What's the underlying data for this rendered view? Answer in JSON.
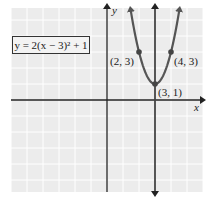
{
  "chart_data": {
    "type": "line",
    "title": "y = 2(x − 3)² + 1",
    "equation": {
      "lhs": "y",
      "rhs": "2(x − 3)² + 1",
      "display": "y = 2(x − 3)² + 1"
    },
    "xlabel": "x",
    "ylabel": "y",
    "xlim": [
      -6,
      6
    ],
    "ylim": [
      -5.75,
      5.75
    ],
    "grid": true,
    "series": [
      {
        "name": "parabola",
        "function": "2*(x-3)^2+1",
        "color": "#555555"
      },
      {
        "name": "axis of symmetry",
        "function": "x=3",
        "color": "#444444"
      }
    ],
    "points": [
      {
        "x": 2,
        "y": 3,
        "label": "(2, 3)"
      },
      {
        "x": 4,
        "y": 3,
        "label": "(4, 3)"
      },
      {
        "x": 3,
        "y": 1,
        "label": "(3, 1)"
      }
    ]
  },
  "labels": {
    "x_axis": "x",
    "y_axis": "y",
    "p1": "(2, 3)",
    "p2": "(4, 3)",
    "vertex": "(3, 1)"
  },
  "colors": {
    "grid_bg": "#ececec",
    "grid_line": "#ffffff",
    "axis": "#222222",
    "curve": "#555555"
  }
}
